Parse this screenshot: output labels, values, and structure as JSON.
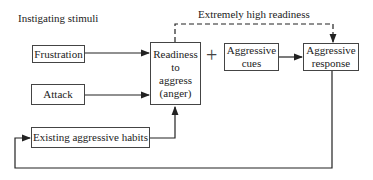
{
  "diagram": {
    "section_label": "Instigating stimuli",
    "dashed_label": "Extremely high readiness",
    "plus_sign": "+",
    "nodes": {
      "frustration": "Frustration",
      "attack": "Attack",
      "habits": "Existing aggressive habits",
      "readiness": [
        "Readiness",
        "to",
        "aggress",
        "(anger)"
      ],
      "cues": [
        "Aggressive",
        "cues"
      ],
      "response": [
        "Aggressive",
        "response"
      ]
    },
    "edges": [
      {
        "from": "Frustration",
        "to": "Readiness to aggress (anger)",
        "style": "solid"
      },
      {
        "from": "Attack",
        "to": "Readiness to aggress (anger)",
        "style": "solid"
      },
      {
        "from": "Existing aggressive habits",
        "to": "Readiness to aggress (anger)",
        "style": "solid"
      },
      {
        "from": "Aggressive cues",
        "to": "Aggressive response",
        "style": "solid"
      },
      {
        "from": "Readiness to aggress (anger)",
        "to": "Aggressive response",
        "style": "dashed",
        "label": "Extremely high readiness"
      },
      {
        "from": "Aggressive response",
        "to": "Existing aggressive habits",
        "style": "solid",
        "note": "feedback loop"
      }
    ]
  }
}
